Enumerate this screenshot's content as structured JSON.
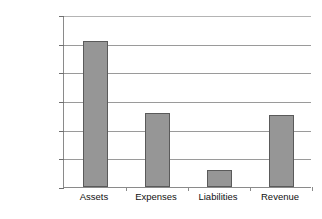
{
  "chart_data": {
    "type": "bar",
    "title": "",
    "xlabel": "",
    "ylabel": "",
    "categories": [
      "Assets",
      "Expenses",
      "Liabilities",
      "Revenue"
    ],
    "values": [
      1020000,
      515000,
      120000,
      505000
    ],
    "ylim": [
      0,
      1200000
    ],
    "ytick_values": [
      1200000,
      1000000,
      800000,
      600000,
      400000,
      200000,
      0
    ],
    "ytick_labels": [
      "$1,200,000",
      "$1,000,000",
      "$800,000",
      "$600,000",
      "$400,000",
      "$200,000",
      "$0"
    ],
    "grid": true,
    "grid_axis": "y",
    "legend": false,
    "legend_position": "none",
    "series": [
      {
        "name": "Amount",
        "values": [
          1020000,
          515000,
          120000,
          505000
        ]
      }
    ],
    "bar_color": "#969696",
    "bar_border_color": "#5a5a5a",
    "axis_color": "#8a8a8a",
    "gridline_color": "#9a9a9a",
    "background_color": "#ffffff",
    "text_color": "#111111"
  }
}
